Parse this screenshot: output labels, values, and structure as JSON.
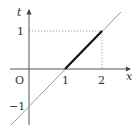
{
  "diagram": {
    "type": "line-graph",
    "axes": {
      "x_label": "x",
      "y_label": "t",
      "origin_label": "O",
      "x_ticks": [
        "1",
        "2"
      ],
      "y_ticks": [
        "1",
        "−1"
      ]
    },
    "lines": [
      {
        "name": "t = x - 1",
        "style": "thin gray",
        "color": "#888888"
      },
      {
        "name": "segment from (1,0) to (2,1)",
        "style": "thick black",
        "color": "#111111"
      }
    ],
    "guides": [
      {
        "name": "horizontal dotted at t=1 from x=0 to x=2"
      },
      {
        "name": "vertical dotted at x=2 from t=0 to t=1"
      }
    ]
  }
}
